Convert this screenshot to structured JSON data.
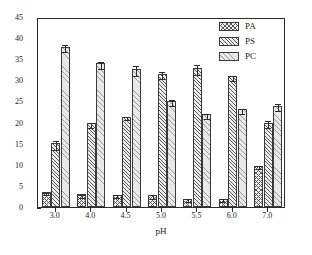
{
  "chart_data": {
    "type": "bar",
    "title": "",
    "xlabel": "pH",
    "ylabel": "生成率(%)",
    "categories": [
      "3.0",
      "4.0",
      "4.5",
      "5.0",
      "5.5",
      "6.0",
      "7.0"
    ],
    "ylim": [
      0,
      45
    ],
    "yticks": [
      0,
      5,
      10,
      15,
      20,
      25,
      30,
      35,
      40,
      45
    ],
    "ytick_labels": [
      "0",
      "5",
      "10",
      "15",
      "20",
      "25",
      "30",
      "35",
      "40",
      "45"
    ],
    "grid": false,
    "legend_position": "top-right",
    "series": [
      {
        "name": "PA",
        "pattern": "cross-hatch",
        "values": [
          3.5,
          3.0,
          2.9,
          2.8,
          2.0,
          2.0,
          9.8
        ],
        "errors": [
          0.3,
          0.3,
          0.3,
          0.4,
          0.3,
          0.3,
          0.4
        ]
      },
      {
        "name": "PS",
        "pattern": "diagonal-hatch",
        "values": [
          15.1,
          19.8,
          21.4,
          31.6,
          33.0,
          31.0,
          20.0
        ],
        "errors": [
          1.1,
          0.5,
          0.4,
          0.8,
          1.2,
          0.6,
          0.9
        ]
      },
      {
        "name": "PC",
        "pattern": "sparse-hatch",
        "values": [
          38.0,
          34.0,
          32.6,
          25.2,
          22.0,
          23.1,
          24.0
        ],
        "errors": [
          0.8,
          0.8,
          1.2,
          0.7,
          0.6,
          0.5,
          0.9
        ]
      }
    ]
  },
  "legend": {
    "items": [
      {
        "label": "PA"
      },
      {
        "label": "PS"
      },
      {
        "label": "PC"
      }
    ]
  }
}
